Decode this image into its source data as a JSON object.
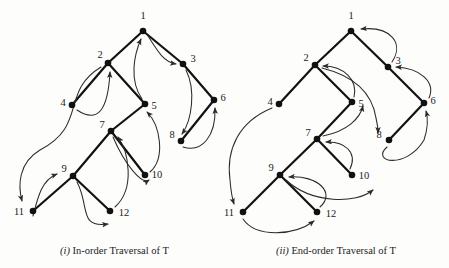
{
  "figure": {
    "panels": [
      {
        "id": "panel-in-order",
        "caption_marker": "(i)",
        "caption_text": " In-order Traversal of T",
        "caption_full": "(i) In-order Traversal of T",
        "traversal_type": "in-order",
        "tree_label": "T",
        "nodes": [
          {
            "id": 1,
            "label": "1",
            "x": 143,
            "y": 31,
            "lx": 143,
            "ly": 19
          },
          {
            "id": 2,
            "label": "2",
            "x": 108,
            "y": 63,
            "lx": 100,
            "ly": 58
          },
          {
            "id": 3,
            "label": "3",
            "x": 183,
            "y": 64,
            "lx": 193,
            "ly": 59
          },
          {
            "id": 4,
            "label": "4",
            "x": 72,
            "y": 105,
            "lx": 63,
            "ly": 102
          },
          {
            "id": 5,
            "label": "5",
            "x": 145,
            "y": 104,
            "lx": 154,
            "ly": 107
          },
          {
            "id": 6,
            "label": "6",
            "x": 214,
            "y": 100,
            "lx": 223,
            "ly": 99
          },
          {
            "id": 7,
            "label": "7",
            "x": 111,
            "y": 131,
            "lx": 102,
            "ly": 127
          },
          {
            "id": 8,
            "label": "8",
            "x": 181,
            "y": 141,
            "lx": 172,
            "ly": 136
          },
          {
            "id": 9,
            "label": "9",
            "x": 73,
            "y": 176,
            "lx": 64,
            "ly": 171
          },
          {
            "id": 10,
            "label": "10",
            "x": 145,
            "y": 175,
            "lx": 153,
            "ly": 175
          },
          {
            "id": 11,
            "label": "11",
            "x": 33,
            "y": 211,
            "lx": 16,
            "ly": 213
          },
          {
            "id": 12,
            "label": "12",
            "x": 110,
            "y": 211,
            "lx": 119,
            "ly": 216
          }
        ],
        "edges": [
          {
            "from": 1,
            "to": 2
          },
          {
            "from": 1,
            "to": 3
          },
          {
            "from": 2,
            "to": 4
          },
          {
            "from": 2,
            "to": 5
          },
          {
            "from": 3,
            "to": 6
          },
          {
            "from": 5,
            "to": 7
          },
          {
            "from": 6,
            "to": 8
          },
          {
            "from": 7,
            "to": 9
          },
          {
            "from": 7,
            "to": 10
          },
          {
            "from": 9,
            "to": 11
          },
          {
            "from": 9,
            "to": 12
          }
        ],
        "traversal_order": [
          4,
          2,
          11,
          9,
          12,
          7,
          10,
          5,
          1,
          3,
          8,
          6
        ]
      },
      {
        "id": "panel-end-order",
        "caption_marker": "(ii)",
        "caption_text": "  End-order Traversal of T",
        "caption_full": "(ii) End-order Traversal of T",
        "traversal_type": "end-order",
        "tree_label": "T",
        "nodes": [
          {
            "id": 1,
            "label": "1",
            "x": 351,
            "y": 31,
            "lx": 351,
            "ly": 19
          },
          {
            "id": 2,
            "label": "2",
            "x": 315,
            "y": 65,
            "lx": 306,
            "ly": 60
          },
          {
            "id": 3,
            "label": "3",
            "x": 388,
            "y": 67,
            "lx": 398,
            "ly": 62
          },
          {
            "id": 4,
            "label": "4",
            "x": 279,
            "y": 104,
            "lx": 270,
            "ly": 101
          },
          {
            "id": 5,
            "label": "5",
            "x": 352,
            "y": 102,
            "lx": 361,
            "ly": 105
          },
          {
            "id": 6,
            "label": "6",
            "x": 424,
            "y": 103,
            "lx": 433,
            "ly": 102
          },
          {
            "id": 7,
            "label": "7",
            "x": 317,
            "y": 139,
            "lx": 308,
            "ly": 134
          },
          {
            "id": 8,
            "label": "8",
            "x": 389,
            "y": 140,
            "lx": 379,
            "ly": 137
          },
          {
            "id": 9,
            "label": "9",
            "x": 280,
            "y": 175,
            "lx": 271,
            "ly": 170
          },
          {
            "id": 10,
            "label": "10",
            "x": 352,
            "y": 175,
            "lx": 360,
            "ly": 177
          },
          {
            "id": 11,
            "label": "11",
            "x": 243,
            "y": 212,
            "lx": 226,
            "ly": 214
          },
          {
            "id": 12,
            "label": "12",
            "x": 317,
            "y": 212,
            "lx": 326,
            "ly": 216
          }
        ],
        "edges": [
          {
            "from": 1,
            "to": 2
          },
          {
            "from": 1,
            "to": 3
          },
          {
            "from": 2,
            "to": 4
          },
          {
            "from": 2,
            "to": 5
          },
          {
            "from": 3,
            "to": 6
          },
          {
            "from": 5,
            "to": 7
          },
          {
            "from": 6,
            "to": 8
          },
          {
            "from": 7,
            "to": 9
          },
          {
            "from": 7,
            "to": 10
          },
          {
            "from": 9,
            "to": 11
          },
          {
            "from": 9,
            "to": 12
          }
        ],
        "traversal_order": [
          4,
          11,
          12,
          9,
          10,
          7,
          5,
          2,
          8,
          6,
          3,
          1
        ]
      }
    ],
    "colors": {
      "background": "#fdfdfc",
      "edge": "#121212",
      "node": "#111111",
      "arc": "#2b2b2b",
      "text": "#1a1a1a"
    }
  }
}
